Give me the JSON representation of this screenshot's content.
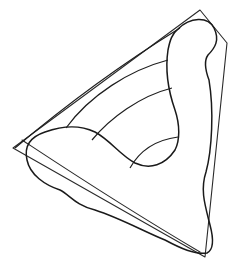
{
  "figure": {
    "stroke_color": "#1a1a1a",
    "background": "#ffffff",
    "outer_polygon": {
      "points": [
        [
          200,
          10
        ],
        [
          227,
          43
        ],
        [
          205,
          257
        ],
        [
          13,
          148
        ]
      ]
    },
    "inner_shape": {
      "arms": [
        "top",
        "left",
        "bottom-right"
      ]
    },
    "arcs": {
      "count": 4
    }
  }
}
